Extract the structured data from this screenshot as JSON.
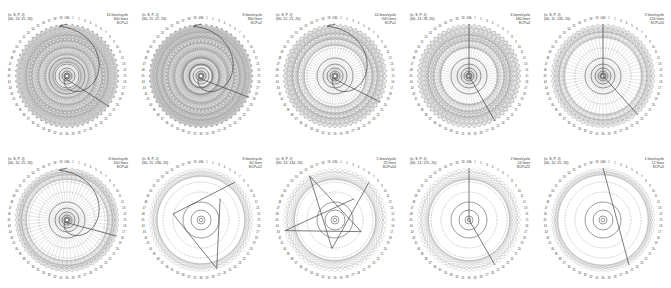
{
  "figure": {
    "point_count": 60,
    "top_label": "0/60",
    "colors": {
      "chord": "#9a9a9a",
      "dashed_circle": "#8a8a8a",
      "solid_circle": "#555555",
      "path": "#444444",
      "label": "#333333"
    },
    "panels": [
      {
        "header": "(n, S, P, J)",
        "params": "(60, 13, 15, 20)",
        "rate": "10 lines/cycle",
        "lines": "300 lines",
        "scp": "SCP=1",
        "skip": 13,
        "density": 300,
        "path_style": "spiral"
      },
      {
        "header": "(n, S, P, J)",
        "params": "(60, 11, 22, 20)",
        "rate": "6 lines/cycle",
        "lines": "360 lines",
        "scp": "SCP=2",
        "skip": 11,
        "density": 360,
        "path_style": "spiral"
      },
      {
        "header": "(n, S, P, J)",
        "params": "(60, 12, 21, 20)",
        "rate": "10 lines/cycle",
        "lines": "200 lines",
        "scp": "SCP=1",
        "skip": 12,
        "density": 200,
        "path_style": "spiral"
      },
      {
        "header": "(n, S, P, J)",
        "params": "(60, 13, 28, 20)",
        "rate": "6 lines/cycle",
        "lines": "180 lines",
        "scp": "SCP=4",
        "skip": 13,
        "density": 180,
        "path_style": "radial"
      },
      {
        "header": "(n, S, P, J)",
        "params": "(60, 11, 145, 20)",
        "rate": "2 lines/cycle",
        "lines": "120 lines",
        "scp": "SCP=10",
        "skip": 11,
        "density": 120,
        "path_style": "radial"
      },
      {
        "header": "(n, S, P, J)",
        "params": "(60, 10, 15, 20)",
        "rate": "6 lines/cycle",
        "lines": "100 lines",
        "scp": "SCP=6",
        "skip": 10,
        "density": 100,
        "path_style": "spiral"
      },
      {
        "header": "(n, S, P, J)",
        "params": "(60, 11, 136, 20)",
        "rate": "6 lines/cycle",
        "lines": "60 lines",
        "scp": "SCP=12",
        "skip": 11,
        "density": 60,
        "path_style": "polygon"
      },
      {
        "header": "(n, S, P, J)",
        "params": "(60, 13, 144, 20)",
        "rate": "5 lines/cycle",
        "lines": "25 lines",
        "scp": "SCP=24",
        "skip": 13,
        "density": 25,
        "path_style": "polygon"
      },
      {
        "header": "(n, S, P, J)",
        "params": "(60, 13, 125, 20)",
        "rate": "2 lines/cycle",
        "lines": "24 lines",
        "scp": "SCP=25",
        "skip": 13,
        "density": 24,
        "path_style": "radial"
      },
      {
        "header": "(n, S, P, J)",
        "params": "(60, 10, 55, 20)",
        "rate": "1 lines/cycle",
        "lines": "12 lines",
        "scp": "SCP=5",
        "skip": 10,
        "density": 12,
        "path_style": "line"
      }
    ]
  }
}
